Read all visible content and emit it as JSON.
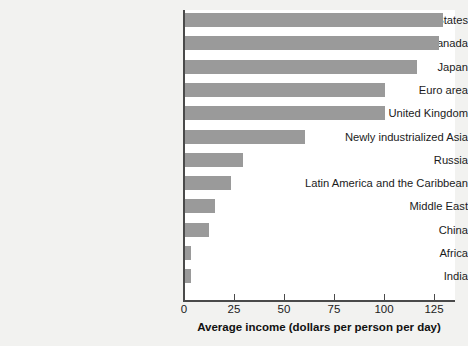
{
  "chart_data": {
    "type": "bar",
    "orientation": "horizontal",
    "title": "",
    "xlabel": "Average income (dollars per person per day)",
    "ylabel": "",
    "xlim": [
      0,
      136
    ],
    "xticks": [
      0,
      25,
      50,
      75,
      100,
      125
    ],
    "xtick_labels": [
      "0",
      "25",
      "50",
      "75",
      "100",
      "125"
    ],
    "grid": false,
    "legend": false,
    "bar_color": "#9a9a9a",
    "plot_background": "#ffffff",
    "figure_background": "#f2f2f0",
    "axis_color": "#4a4a4a",
    "categories": [
      "United States",
      "Canada",
      "Japan",
      "Euro area",
      "United Kingdom",
      "Newly industrialized Asia",
      "Russia",
      "Latin America and the Caribbean",
      "Middle East",
      "China",
      "Africa",
      "India"
    ],
    "values": [
      129,
      127,
      116,
      100,
      100,
      60,
      29,
      23,
      15,
      12,
      3,
      3
    ]
  }
}
